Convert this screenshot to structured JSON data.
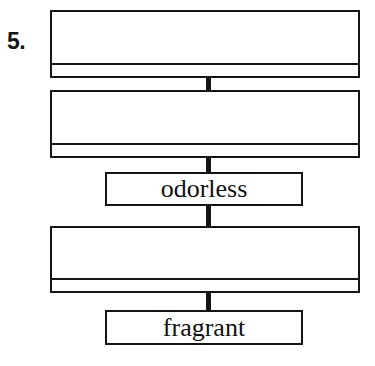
{
  "worksheet": {
    "item_number": "5.",
    "diagram_type": "vertical-flow-chart",
    "boxes": [
      {
        "id": "box-1",
        "kind": "split-answer-box",
        "main_value": "",
        "strip_value": "",
        "filled": false
      },
      {
        "id": "box-2",
        "kind": "split-answer-box",
        "main_value": "",
        "strip_value": "",
        "filled": false
      },
      {
        "id": "word-odorless",
        "kind": "word-box",
        "label": "odorless",
        "filled": true
      },
      {
        "id": "box-3",
        "kind": "split-answer-box",
        "main_value": "",
        "strip_value": "",
        "filled": false
      },
      {
        "id": "word-fragrant",
        "kind": "word-box",
        "label": "fragrant",
        "filled": true
      }
    ],
    "connectors": [
      {
        "id": "connector-1",
        "from": "box-1",
        "to": "box-2"
      },
      {
        "id": "connector-2",
        "from": "box-2",
        "to": "word-odorless"
      },
      {
        "id": "connector-3",
        "from": "word-odorless",
        "to": "box-3"
      },
      {
        "id": "connector-4",
        "from": "box-3",
        "to": "word-fragrant"
      }
    ],
    "colors": {
      "ink": "#151515",
      "paper": "#ffffff"
    }
  }
}
